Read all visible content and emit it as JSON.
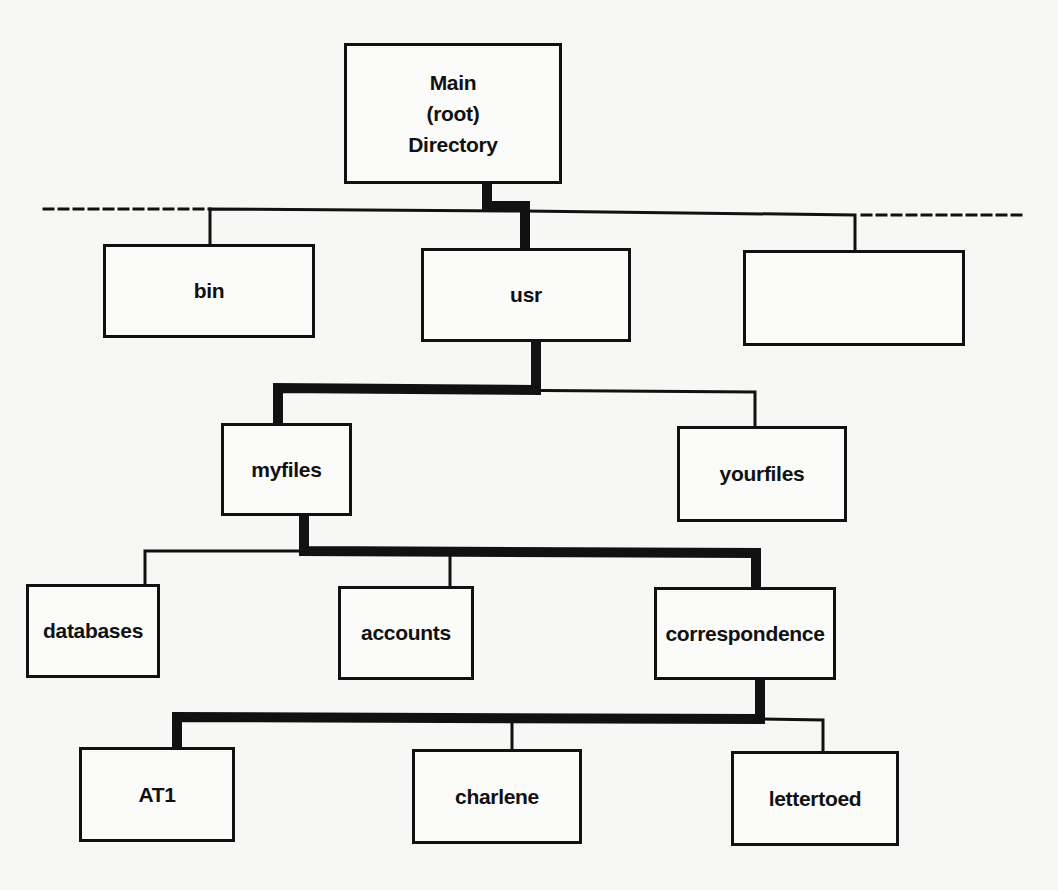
{
  "diagram": {
    "type": "directory-tree",
    "highlighted_path": [
      "Main (root) Directory",
      "usr",
      "myfiles",
      "correspondence",
      "AT1"
    ],
    "nodes": {
      "root": {
        "lines": [
          "Main",
          "(root)",
          "Directory"
        ]
      },
      "bin": {
        "label": "bin"
      },
      "usr": {
        "label": "usr"
      },
      "unnamed": {
        "label": ""
      },
      "myfiles": {
        "label": "myfiles"
      },
      "yourfiles": {
        "label": "yourfiles"
      },
      "databases": {
        "label": "databases"
      },
      "accounts": {
        "label": "accounts"
      },
      "correspondence": {
        "label": "correspondence"
      },
      "at1": {
        "label": "AT1"
      },
      "charlene": {
        "label": "charlene"
      },
      "lettertoed": {
        "label": "lettertoed"
      }
    },
    "edges": [
      [
        "root",
        "bin"
      ],
      [
        "root",
        "usr"
      ],
      [
        "root",
        "unnamed"
      ],
      [
        "usr",
        "myfiles"
      ],
      [
        "usr",
        "yourfiles"
      ],
      [
        "myfiles",
        "databases"
      ],
      [
        "myfiles",
        "accounts"
      ],
      [
        "myfiles",
        "correspondence"
      ],
      [
        "correspondence",
        "at1"
      ],
      [
        "correspondence",
        "charlene"
      ],
      [
        "correspondence",
        "lettertoed"
      ]
    ]
  }
}
